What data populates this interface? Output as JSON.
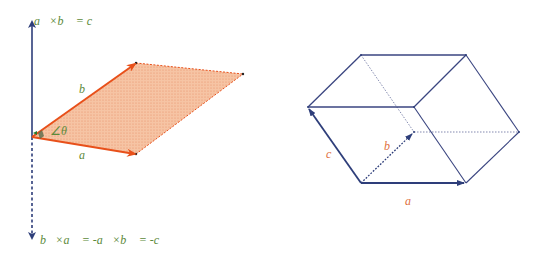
{
  "colors": {
    "axis": "#2e3e7a",
    "vector_orange": "#e8501a",
    "fill_orange": "#f4b48c",
    "label_green": "#5c8a3a",
    "label_orange": "#e07040",
    "box_edge": "#3a4580"
  },
  "left_figure": {
    "top_label": "a⃗×b⃗ = c⃗",
    "bottom_label": "b⃗×a⃗ = -a⃗×b⃗ = -c⃗",
    "vector_a_label": "a⃗",
    "vector_b_label": "b⃗",
    "angle_label": "∠θ"
  },
  "right_figure": {
    "vector_a_label": "a⃗",
    "vector_b_label": "b⃗",
    "vector_c_label": "c⃗"
  }
}
